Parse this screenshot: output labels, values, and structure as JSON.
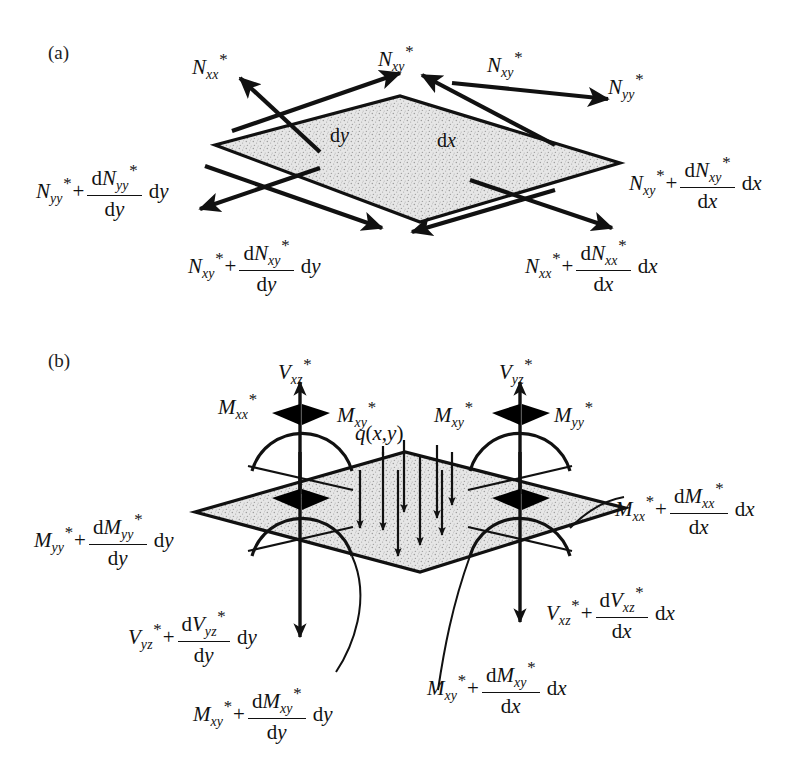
{
  "figure": {
    "title_a": "(a)",
    "title_b": "(b)"
  },
  "colors": {
    "ink": "#111111",
    "plate_fill": "#e3e3e3",
    "speckle": "#9a9a9a",
    "background": "#ffffff"
  },
  "panel_a": {
    "label": "(a)",
    "plate_dims": {
      "dy": "dy",
      "dx": "dx"
    },
    "labels": {
      "nxx_top": {
        "base": "N",
        "sub": "xx",
        "star": true
      },
      "nxy_top_left": {
        "base": "N",
        "sub": "xy",
        "star": true
      },
      "nxy_top_right": {
        "base": "N",
        "sub": "xy",
        "star": true
      },
      "nyy_top": {
        "base": "N",
        "sub": "yy",
        "star": true
      },
      "nyy_incr": {
        "base": "N",
        "sub": "yy",
        "star": true,
        "num_base": "N",
        "num_sub": "yy",
        "den": "dy",
        "tail": "dy"
      },
      "nxy_incr_dy": {
        "base": "N",
        "sub": "xy",
        "star": true,
        "num_base": "N",
        "num_sub": "xy",
        "den": "dy",
        "tail": "dy"
      },
      "nxy_incr_dx": {
        "base": "N",
        "sub": "xy",
        "star": true,
        "num_base": "N",
        "num_sub": "xy",
        "den": "dx",
        "tail": "dx"
      },
      "nxx_incr_dx": {
        "base": "N",
        "sub": "xx",
        "star": true,
        "num_base": "N",
        "num_sub": "xx",
        "den": "dx",
        "tail": "dx"
      }
    }
  },
  "panel_b": {
    "label": "(b)",
    "load": {
      "text": "q(x,y)",
      "base": "q",
      "args": "(x,y)"
    },
    "labels": {
      "vxz": {
        "base": "V",
        "sub": "xz",
        "star": true
      },
      "vyz": {
        "base": "V",
        "sub": "yz",
        "star": true
      },
      "mxx_left": {
        "base": "M",
        "sub": "xx",
        "star": true
      },
      "mxy_left": {
        "base": "M",
        "sub": "xy",
        "star": true
      },
      "mxy_right": {
        "base": "M",
        "sub": "xy",
        "star": true
      },
      "myy_right": {
        "base": "M",
        "sub": "yy",
        "star": true
      },
      "myy_incr": {
        "base": "M",
        "sub": "yy",
        "star": true,
        "num_base": "M",
        "num_sub": "yy",
        "den": "dy",
        "tail": "dy"
      },
      "mxx_incr": {
        "base": "M",
        "sub": "xx",
        "star": true,
        "num_base": "M",
        "num_sub": "xx",
        "den": "dx",
        "tail": "dx"
      },
      "vyz_incr": {
        "base": "V",
        "sub": "yz",
        "star": true,
        "num_base": "V",
        "num_sub": "yz",
        "den": "dy",
        "tail": "dy"
      },
      "vxz_incr": {
        "base": "V",
        "sub": "xz",
        "star": true,
        "num_base": "V",
        "num_sub": "xz",
        "den": "dx",
        "tail": "dx"
      },
      "mxy_incr_dy": {
        "base": "M",
        "sub": "xy",
        "star": true,
        "num_base": "M",
        "num_sub": "xy",
        "den": "dy",
        "tail": "dy"
      },
      "mxy_incr_dx": {
        "base": "M",
        "sub": "xy",
        "star": true,
        "num_base": "M",
        "num_sub": "xy",
        "den": "dx",
        "tail": "dx"
      }
    }
  }
}
